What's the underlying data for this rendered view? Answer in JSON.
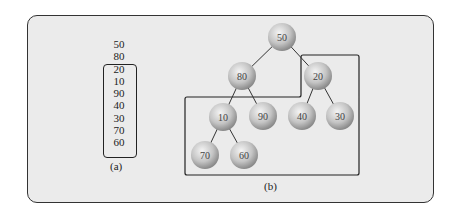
{
  "figure": {
    "panel_a": {
      "caption": "(a)",
      "outside_items": [
        "50",
        "80"
      ],
      "boxed_items": [
        "20",
        "10",
        "90",
        "40",
        "30",
        "70",
        "60"
      ]
    },
    "panel_b": {
      "caption": "(b)",
      "nodes": [
        {
          "id": "n50",
          "label": "50",
          "x": 282,
          "y": 37
        },
        {
          "id": "n80",
          "label": "80",
          "x": 242,
          "y": 76
        },
        {
          "id": "n20",
          "label": "20",
          "x": 318,
          "y": 76
        },
        {
          "id": "n10",
          "label": "10",
          "x": 223,
          "y": 117
        },
        {
          "id": "n90",
          "label": "90",
          "x": 263,
          "y": 116
        },
        {
          "id": "n40",
          "label": "40",
          "x": 302,
          "y": 116
        },
        {
          "id": "n30",
          "label": "30",
          "x": 340,
          "y": 116
        },
        {
          "id": "n70",
          "label": "70",
          "x": 205,
          "y": 155
        },
        {
          "id": "n60",
          "label": "60",
          "x": 244,
          "y": 155
        }
      ],
      "edges": [
        [
          "n50",
          "n80"
        ],
        [
          "n50",
          "n20"
        ],
        [
          "n80",
          "n10"
        ],
        [
          "n80",
          "n90"
        ],
        [
          "n20",
          "n40"
        ],
        [
          "n20",
          "n30"
        ],
        [
          "n10",
          "n70"
        ],
        [
          "n10",
          "n60"
        ]
      ]
    },
    "colors": {
      "frame_bg": "#ebebeb",
      "stroke": "#222222",
      "node_light": "#f2f2f2",
      "node_dark": "#8a8a8a"
    }
  }
}
